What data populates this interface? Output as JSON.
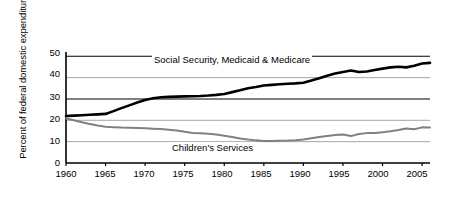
{
  "chart_data": {
    "type": "line",
    "title": "",
    "xlabel": "",
    "ylabel": "Percent of federal domestic expenditures",
    "xlim": [
      1960,
      2006
    ],
    "ylim": [
      0,
      52
    ],
    "xticks": [
      1960,
      1965,
      1970,
      1975,
      1980,
      1985,
      1990,
      1995,
      2000,
      2005
    ],
    "yticks": [
      0,
      10,
      20,
      30,
      40,
      50
    ],
    "grid": true,
    "grid_note": "horizontal gridlines only; 50 and 30 drawn dark, 40/20/10 drawn light gray",
    "legend_position": "inline-annotation",
    "x": [
      1960,
      1961,
      1962,
      1963,
      1964,
      1965,
      1966,
      1967,
      1968,
      1969,
      1970,
      1971,
      1972,
      1973,
      1974,
      1975,
      1976,
      1977,
      1978,
      1979,
      1980,
      1981,
      1982,
      1983,
      1984,
      1985,
      1986,
      1987,
      1988,
      1989,
      1990,
      1991,
      1992,
      1993,
      1994,
      1995,
      1996,
      1997,
      1998,
      1999,
      2000,
      2001,
      2002,
      2003,
      2004,
      2005,
      2006
    ],
    "series": [
      {
        "name": "Social Security, Medicaid & Medicare",
        "color": "#000000",
        "values": [
          22.0,
          22.2,
          22.4,
          22.6,
          22.8,
          23.0,
          24.3,
          25.7,
          27.0,
          28.3,
          29.5,
          30.3,
          30.8,
          31.0,
          31.1,
          31.2,
          31.3,
          31.4,
          31.6,
          31.9,
          32.3,
          33.2,
          34.1,
          35.0,
          35.6,
          36.3,
          36.6,
          36.9,
          37.1,
          37.3,
          37.6,
          38.6,
          39.7,
          40.9,
          41.9,
          42.6,
          43.3,
          42.6,
          42.9,
          43.6,
          44.2,
          44.8,
          45.1,
          44.8,
          45.6,
          46.6,
          46.9
        ]
      },
      {
        "name": "Children's Services",
        "color": "#808080",
        "values": [
          21.0,
          20.0,
          19.1,
          18.3,
          17.6,
          17.0,
          16.8,
          16.6,
          16.5,
          16.4,
          16.3,
          16.1,
          15.9,
          15.6,
          15.2,
          14.6,
          14.1,
          13.9,
          13.7,
          13.3,
          12.8,
          12.2,
          11.5,
          11.0,
          10.6,
          10.3,
          10.3,
          10.4,
          10.5,
          10.7,
          11.0,
          11.6,
          12.2,
          12.7,
          13.1,
          13.4,
          12.6,
          13.6,
          14.0,
          14.1,
          14.4,
          14.9,
          15.5,
          16.2,
          15.8,
          16.7,
          16.6
        ]
      }
    ]
  },
  "annotations": {
    "social_security_label": "Social Security, Medicaid & Medicare",
    "childrens_services_label": "Children's Services"
  }
}
